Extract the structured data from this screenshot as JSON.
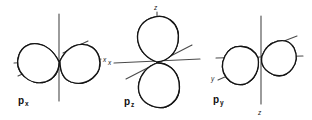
{
  "figure": {
    "background_color": "#ffffff",
    "ink_color": "#141414",
    "axis_color": "#4a4a4a",
    "width": 312,
    "height": 120
  },
  "diagrams": [
    {
      "id": "px",
      "label_base": "p",
      "label_sub": "x",
      "orientation": "horizontal",
      "lobe_count": 2,
      "axis_labels": [
        {
          "name": "x",
          "text": "x",
          "position": "right"
        }
      ],
      "axes": [
        {
          "name": "vertical-axis",
          "from": [
            59,
            14
          ],
          "to": [
            59,
            101
          ]
        },
        {
          "name": "horizontal-axis",
          "from": [
            14,
            63
          ],
          "to": [
            101,
            59
          ]
        },
        {
          "name": "depth-axis-upper",
          "from": [
            63,
            53
          ],
          "to": [
            88,
            41
          ]
        },
        {
          "name": "depth-axis-lower",
          "from": [
            18,
            76
          ],
          "to": [
            40,
            66
          ]
        }
      ]
    },
    {
      "id": "pz",
      "label_base": "p",
      "label_sub": "z",
      "orientation": "vertical",
      "lobe_count": 2,
      "axis_labels": [
        {
          "name": "z",
          "text": "z",
          "position": "top"
        },
        {
          "name": "x",
          "text": "x",
          "position": "left"
        }
      ],
      "axes": [
        {
          "name": "vertical-axis",
          "from": [
            157,
            12
          ],
          "to": [
            157,
            103
          ]
        },
        {
          "name": "horizontal-axis",
          "from": [
            114,
            63
          ],
          "to": [
            200,
            59
          ]
        },
        {
          "name": "depth-axis",
          "from": [
            126,
            79
          ],
          "to": [
            192,
            45
          ]
        }
      ]
    },
    {
      "id": "py",
      "label_base": "p",
      "label_sub": "y",
      "orientation": "diagonal",
      "lobe_count": 2,
      "axis_labels": [
        {
          "name": "y",
          "text": "y",
          "position": "lower-left"
        },
        {
          "name": "z",
          "text": "z",
          "position": "bottom"
        }
      ],
      "axes": [
        {
          "name": "vertical-axis",
          "from": [
            261,
            16
          ],
          "to": [
            261,
            104
          ]
        },
        {
          "name": "horizontal-axis",
          "from": [
            216,
            58
          ],
          "to": [
            303,
            56
          ]
        },
        {
          "name": "depth-axis-upper",
          "from": [
            266,
            48
          ],
          "to": [
            297,
            36
          ]
        },
        {
          "name": "depth-axis-lower",
          "from": [
            218,
            80
          ],
          "to": [
            243,
            69
          ]
        }
      ]
    }
  ]
}
